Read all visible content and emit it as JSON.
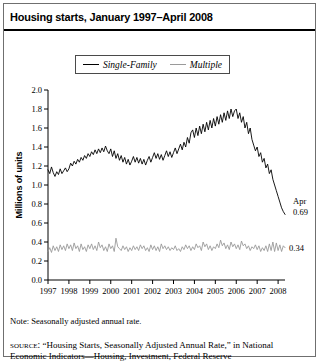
{
  "figure": {
    "title": "Housing starts, January 1997–April 2008",
    "note": "Note: Seasonally adjusted annual rate.",
    "source_label": "source:",
    "source_text": "“Housing Starts, Seasonally Adjusted Annual Rate,” in National Economic Indicators—Housing, Investment, Federal Reserve"
  },
  "legend": {
    "entries": [
      {
        "label": "Single-Family",
        "color": "#000000"
      },
      {
        "label": "Multiple",
        "color": "#9a9a9a"
      }
    ]
  },
  "annotations": {
    "single_family_month": "Apr",
    "single_family_value": "0.69",
    "multiple_value": "0.34"
  },
  "chart_data": {
    "type": "line",
    "title": "Housing starts, January 1997–April 2008",
    "xlabel": "",
    "ylabel": "Millions of units",
    "ylim": [
      0.0,
      2.0
    ],
    "xlim": [
      1997.0,
      2008.33
    ],
    "grid": false,
    "legend_position": "top-center",
    "y_ticks": [
      "0.0",
      "0.2",
      "0.4",
      "0.6",
      "0.8",
      "1.0",
      "1.2",
      "1.4",
      "1.6",
      "1.8",
      "2.0"
    ],
    "x_ticks": [
      "1997",
      "1998",
      "1999",
      "2000",
      "2001",
      "2002",
      "2003",
      "2004",
      "2005",
      "2006",
      "2007",
      "2008"
    ],
    "note": "Seasonally adjusted annual rate; monthly observations.",
    "series": [
      {
        "name": "Single-Family",
        "color": "#000000",
        "x_start": 1997.0,
        "x_step": 0.08333,
        "values": [
          1.16,
          1.12,
          1.19,
          1.13,
          1.09,
          1.14,
          1.11,
          1.17,
          1.12,
          1.15,
          1.18,
          1.14,
          1.17,
          1.23,
          1.2,
          1.25,
          1.22,
          1.27,
          1.24,
          1.29,
          1.26,
          1.31,
          1.28,
          1.33,
          1.3,
          1.35,
          1.32,
          1.37,
          1.33,
          1.38,
          1.34,
          1.39,
          1.35,
          1.41,
          1.36,
          1.33,
          1.38,
          1.3,
          1.36,
          1.28,
          1.33,
          1.26,
          1.31,
          1.24,
          1.29,
          1.22,
          1.27,
          1.21,
          1.25,
          1.3,
          1.24,
          1.29,
          1.23,
          1.28,
          1.22,
          1.27,
          1.21,
          1.26,
          1.3,
          1.24,
          1.29,
          1.34,
          1.28,
          1.33,
          1.27,
          1.32,
          1.26,
          1.31,
          1.36,
          1.3,
          1.35,
          1.29,
          1.34,
          1.39,
          1.33,
          1.38,
          1.43,
          1.37,
          1.45,
          1.4,
          1.5,
          1.44,
          1.55,
          1.58,
          1.5,
          1.6,
          1.52,
          1.62,
          1.54,
          1.64,
          1.56,
          1.66,
          1.58,
          1.68,
          1.6,
          1.7,
          1.62,
          1.72,
          1.64,
          1.74,
          1.66,
          1.76,
          1.68,
          1.78,
          1.7,
          1.8,
          1.72,
          1.78,
          1.8,
          1.7,
          1.76,
          1.66,
          1.72,
          1.6,
          1.66,
          1.54,
          1.6,
          1.48,
          1.42,
          1.36,
          1.4,
          1.3,
          1.34,
          1.24,
          1.28,
          1.18,
          1.22,
          1.12,
          1.16,
          1.06,
          1.0,
          0.94,
          0.88,
          0.82,
          0.76,
          0.72,
          0.69
        ],
        "last_value": 0.69,
        "last_label": "Apr 0.69"
      },
      {
        "name": "Multiple",
        "color": "#9a9a9a",
        "x_start": 1997.0,
        "x_step": 0.08333,
        "values": [
          0.3,
          0.34,
          0.29,
          0.36,
          0.31,
          0.35,
          0.3,
          0.37,
          0.32,
          0.36,
          0.31,
          0.38,
          0.33,
          0.37,
          0.31,
          0.39,
          0.33,
          0.36,
          0.3,
          0.38,
          0.32,
          0.35,
          0.3,
          0.37,
          0.33,
          0.38,
          0.32,
          0.36,
          0.31,
          0.4,
          0.34,
          0.37,
          0.31,
          0.35,
          0.3,
          0.38,
          0.33,
          0.36,
          0.3,
          0.44,
          0.35,
          0.33,
          0.31,
          0.36,
          0.32,
          0.35,
          0.3,
          0.34,
          0.31,
          0.36,
          0.32,
          0.35,
          0.31,
          0.37,
          0.33,
          0.36,
          0.31,
          0.34,
          0.3,
          0.37,
          0.32,
          0.36,
          0.31,
          0.35,
          0.3,
          0.38,
          0.33,
          0.36,
          0.32,
          0.35,
          0.31,
          0.34,
          0.32,
          0.36,
          0.31,
          0.33,
          0.3,
          0.35,
          0.32,
          0.37,
          0.33,
          0.36,
          0.31,
          0.35,
          0.32,
          0.38,
          0.34,
          0.36,
          0.31,
          0.4,
          0.35,
          0.38,
          0.32,
          0.36,
          0.31,
          0.35,
          0.33,
          0.38,
          0.34,
          0.42,
          0.36,
          0.39,
          0.33,
          0.37,
          0.32,
          0.4,
          0.35,
          0.38,
          0.33,
          0.37,
          0.32,
          0.41,
          0.36,
          0.38,
          0.33,
          0.36,
          0.31,
          0.35,
          0.33,
          0.37,
          0.32,
          0.36,
          0.3,
          0.34,
          0.31,
          0.36,
          0.3,
          0.38,
          0.31,
          0.4,
          0.3,
          0.39,
          0.31,
          0.37,
          0.3,
          0.36,
          0.34
        ],
        "last_value": 0.34,
        "last_label": "0.34"
      }
    ]
  }
}
